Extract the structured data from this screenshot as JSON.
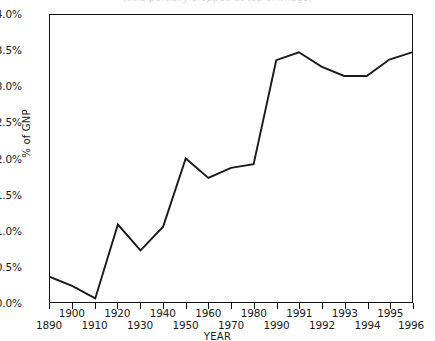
{
  "chart_data": {
    "type": "line",
    "title": "(title partially cropped at top of image)",
    "xlabel": "YEAR",
    "ylabel": "% of GNP",
    "ylim": [
      0.0,
      4.0
    ],
    "ytick_labels": [
      "0.0%",
      "0.5%",
      "1.0%",
      "1.5%",
      "2.0%",
      "2.5%",
      "3.0%",
      "3.5%",
      "4.0%"
    ],
    "ytick_values": [
      0.0,
      0.5,
      1.0,
      1.5,
      2.0,
      2.5,
      3.0,
      3.5,
      4.0
    ],
    "grid": false,
    "legend": "none",
    "axis_note": "x-axis scale is non-uniform: decade steps 1890-1990, then annual steps 1991-1996; all ticks evenly spaced",
    "categories": [
      "1890",
      "1900",
      "1910",
      "1920",
      "1930",
      "1940",
      "1950",
      "1960",
      "1970",
      "1980",
      "1990",
      "1991",
      "1992",
      "1993",
      "1994",
      "1995",
      "1996"
    ],
    "x": [
      "1890",
      "1900",
      "1910",
      "1920",
      "1930",
      "1940",
      "1950",
      "1960",
      "1970",
      "1980",
      "1990",
      "1991",
      "1992",
      "1993",
      "1994",
      "1995",
      "1996"
    ],
    "values": [
      0.35,
      0.22,
      0.05,
      1.08,
      0.72,
      1.05,
      2.0,
      1.73,
      1.87,
      1.92,
      3.37,
      3.48,
      3.28,
      3.15,
      3.15,
      3.38,
      3.48
    ],
    "series": [
      {
        "name": "% of GNP",
        "color": "#1a1a1a",
        "values": [
          0.35,
          0.22,
          0.05,
          1.08,
          0.72,
          1.05,
          2.0,
          1.73,
          1.87,
          1.92,
          3.37,
          3.48,
          3.28,
          3.15,
          3.15,
          3.38,
          3.48
        ]
      }
    ],
    "xtick_rows": {
      "row_a": [
        "1900",
        "1920",
        "1940",
        "1960",
        "1980",
        "1991",
        "1993",
        "1995"
      ],
      "row_b": [
        "1890",
        "1910",
        "1930",
        "1950",
        "1970",
        "1990",
        "1992",
        "1994",
        "1996"
      ]
    }
  }
}
